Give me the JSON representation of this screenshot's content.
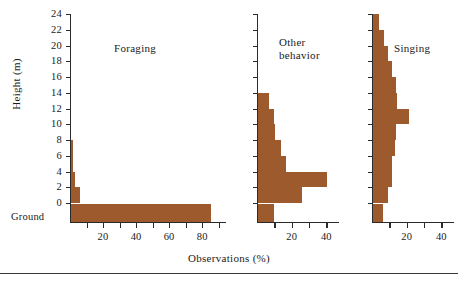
{
  "figure": {
    "xlabel": "Observations (%)",
    "ylabel": "Height (m)",
    "ground_label": "Ground",
    "bar_color": "#9C5A2D",
    "axis_color": "#2b2b2b"
  },
  "yaxis": {
    "ticks": [
      "24",
      "22",
      "20",
      "18",
      "16",
      "14",
      "12",
      "10",
      "8",
      "6",
      "4",
      "2",
      "0"
    ],
    "values": [
      24,
      22,
      20,
      18,
      16,
      14,
      12,
      10,
      8,
      6,
      4,
      2,
      0
    ],
    "min": 0,
    "max": 24,
    "ground_category": "Ground"
  },
  "panels": [
    {
      "title": "Foraging",
      "title_lines": [
        "Foraging"
      ],
      "xticks": [
        "20",
        "40",
        "60",
        "80"
      ],
      "xtick_values": [
        20,
        40,
        60,
        80
      ],
      "xmin": 0,
      "xmax": 92
    },
    {
      "title": "Other behavior",
      "title_lines": [
        "Other",
        "behavior"
      ],
      "xticks": [
        "20",
        "40"
      ],
      "xtick_values": [
        20,
        40
      ],
      "xmin": 0,
      "xmax": 45
    },
    {
      "title": "Singing",
      "title_lines": [
        "Singing"
      ],
      "xticks": [
        "20",
        "40"
      ],
      "xtick_values": [
        20,
        40
      ],
      "xmin": 0,
      "xmax": 45
    }
  ],
  "chart_data": {
    "type": "bar",
    "title": "",
    "xlabel": "Observations (%)",
    "ylabel": "Height (m)",
    "orientation": "horizontal",
    "grid": false,
    "legend": "none",
    "ylim": [
      0,
      24
    ],
    "height_bins": [
      "Ground",
      "0-2",
      "2-4",
      "4-6",
      "6-8",
      "8-10",
      "10-12",
      "12-14",
      "14-16",
      "16-18",
      "18-20",
      "20-22",
      "22-24"
    ],
    "series": [
      {
        "name": "Foraging",
        "xlim": [
          0,
          92
        ],
        "values": [
          85,
          5.5,
          2.2,
          1.2,
          1.2,
          0,
          0,
          0,
          0,
          0,
          0,
          0,
          0
        ]
      },
      {
        "name": "Other behavior",
        "xlim": [
          0,
          45
        ],
        "values": [
          9.5,
          25.5,
          40,
          16,
          13,
          10,
          9.5,
          6.5,
          0,
          0,
          0,
          0,
          0
        ]
      },
      {
        "name": "Singing",
        "xlim": [
          0,
          45
        ],
        "values": [
          5.5,
          8.5,
          11,
          11,
          12.5,
          13.5,
          21,
          14,
          13.5,
          11,
          8.5,
          6.5,
          3.5
        ]
      }
    ]
  }
}
